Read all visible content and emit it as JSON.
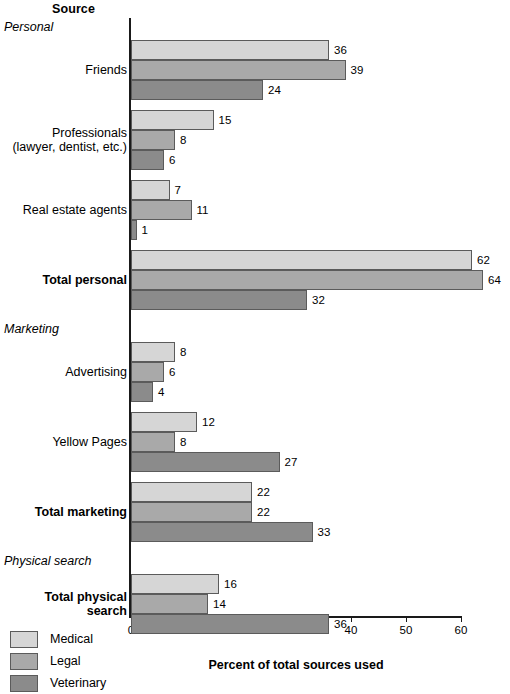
{
  "header": {
    "title": "Source"
  },
  "legend": {
    "position": "bottom-left",
    "entries": [
      {
        "label": "Medical",
        "color": "#d6d6d6",
        "key": "medical"
      },
      {
        "label": "Legal",
        "color": "#a9a9a9",
        "key": "legal"
      },
      {
        "label": "Veterinary",
        "color": "#8b8b8b",
        "key": "veterinary"
      }
    ]
  },
  "chart_data": {
    "type": "bar",
    "orientation": "horizontal",
    "title": "Source",
    "xlabel": "Percent of total sources used",
    "ylabel": "",
    "xlim": [
      0,
      60
    ],
    "xticks": [
      0,
      10,
      20,
      30,
      40,
      50,
      60
    ],
    "xtick_labels": [
      "0",
      "10",
      "20",
      "30",
      "40",
      "50",
      "60"
    ],
    "grid": false,
    "legend_position": "bottom-left",
    "series": [
      {
        "name": "Medical",
        "color": "#d6d6d6"
      },
      {
        "name": "Legal",
        "color": "#a9a9a9"
      },
      {
        "name": "Veterinary",
        "color": "#8b8b8b"
      }
    ],
    "categories": [
      "Friends",
      "Professionals (lawyer, dentist, etc.)",
      "Real estate agents",
      "Total personal",
      "Advertising",
      "Yellow Pages",
      "Total marketing",
      "Total physical search"
    ],
    "values": {
      "Medical": [
        36,
        15,
        7,
        62,
        8,
        12,
        22,
        16
      ],
      "Legal": [
        39,
        8,
        11,
        64,
        6,
        8,
        22,
        14
      ],
      "Veterinary": [
        24,
        6,
        1,
        32,
        4,
        27,
        33,
        36
      ]
    },
    "group_headings": [
      "Personal",
      "Marketing",
      "Physical search"
    ]
  },
  "rows": [
    {
      "kind": "heading",
      "label": "Personal"
    },
    {
      "kind": "group",
      "label": "Friends",
      "bold": false,
      "bars": [
        {
          "series": "Medical",
          "key": "medical",
          "value": 36
        },
        {
          "series": "Legal",
          "key": "legal",
          "value": 39
        },
        {
          "series": "Veterinary",
          "key": "veterinary",
          "value": 24
        }
      ]
    },
    {
      "kind": "group",
      "label": "Professionals\n(lawyer, dentist, etc.)",
      "bold": false,
      "bars": [
        {
          "series": "Medical",
          "key": "medical",
          "value": 15
        },
        {
          "series": "Legal",
          "key": "legal",
          "value": 8
        },
        {
          "series": "Veterinary",
          "key": "veterinary",
          "value": 6
        }
      ]
    },
    {
      "kind": "group",
      "label": "Real estate agents",
      "bold": false,
      "bars": [
        {
          "series": "Medical",
          "key": "medical",
          "value": 7
        },
        {
          "series": "Legal",
          "key": "legal",
          "value": 11
        },
        {
          "series": "Veterinary",
          "key": "veterinary",
          "value": 1
        }
      ]
    },
    {
      "kind": "group",
      "label": "Total personal",
      "bold": true,
      "bars": [
        {
          "series": "Medical",
          "key": "medical",
          "value": 62
        },
        {
          "series": "Legal",
          "key": "legal",
          "value": 64
        },
        {
          "series": "Veterinary",
          "key": "veterinary",
          "value": 32
        }
      ]
    },
    {
      "kind": "heading",
      "label": "Marketing"
    },
    {
      "kind": "group",
      "label": "Advertising",
      "bold": false,
      "bars": [
        {
          "series": "Medical",
          "key": "medical",
          "value": 8
        },
        {
          "series": "Legal",
          "key": "legal",
          "value": 6
        },
        {
          "series": "Veterinary",
          "key": "veterinary",
          "value": 4
        }
      ]
    },
    {
      "kind": "group",
      "label": "Yellow Pages",
      "bold": false,
      "bars": [
        {
          "series": "Medical",
          "key": "medical",
          "value": 12
        },
        {
          "series": "Legal",
          "key": "legal",
          "value": 8
        },
        {
          "series": "Veterinary",
          "key": "veterinary",
          "value": 27
        }
      ]
    },
    {
      "kind": "group",
      "label": "Total marketing",
      "bold": true,
      "bars": [
        {
          "series": "Medical",
          "key": "medical",
          "value": 22
        },
        {
          "series": "Legal",
          "key": "legal",
          "value": 22
        },
        {
          "series": "Veterinary",
          "key": "veterinary",
          "value": 33
        }
      ]
    },
    {
      "kind": "heading",
      "label": "Physical search"
    },
    {
      "kind": "group",
      "label": "Total physical\nsearch",
      "bold": true,
      "bars": [
        {
          "series": "Medical",
          "key": "medical",
          "value": 16
        },
        {
          "series": "Legal",
          "key": "legal",
          "value": 14
        },
        {
          "series": "Veterinary",
          "key": "veterinary",
          "value": 36
        }
      ]
    }
  ],
  "axis": {
    "ticks": [
      "0",
      "10",
      "20",
      "30",
      "40",
      "50",
      "60"
    ],
    "title": "Percent of total sources used"
  }
}
